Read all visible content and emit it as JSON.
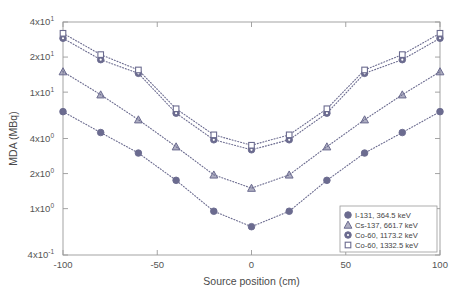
{
  "chart_data": {
    "type": "line",
    "title": "",
    "xlabel": "Source position (cm)",
    "ylabel": "MDA (MBq)",
    "yscale": "log",
    "xscale": "linear",
    "xlim": [
      -100,
      100
    ],
    "ylim": [
      0.4,
      40
    ],
    "grid": false,
    "legend_position": "lower right",
    "x": [
      -100,
      -80,
      -60,
      -40,
      -20,
      0,
      20,
      40,
      60,
      80,
      100
    ],
    "xticks": [
      -100,
      -50,
      0,
      50,
      100
    ],
    "xticklabels": [
      "-100",
      "-50",
      "0",
      "50",
      "100"
    ],
    "yticks": [
      0.4,
      1,
      2,
      4,
      10,
      20,
      40
    ],
    "yticklabels": [
      {
        "mant": "4x10",
        "exp": "-1"
      },
      {
        "mant": "1x10",
        "exp": "0"
      },
      {
        "mant": "2x10",
        "exp": "0"
      },
      {
        "mant": "4x10",
        "exp": "0"
      },
      {
        "mant": "1x10",
        "exp": "1"
      },
      {
        "mant": "2x10",
        "exp": "1"
      },
      {
        "mant": "4x10",
        "exp": "1"
      }
    ],
    "series": [
      {
        "name": "I-131, 364.5 keV",
        "marker": "circle-filled",
        "color": "#6b6b8f",
        "values": [
          6.8,
          4.5,
          3.0,
          1.75,
          0.95,
          0.7,
          0.95,
          1.75,
          3.0,
          4.5,
          6.8
        ]
      },
      {
        "name": "Cs-137, 661.7 keV",
        "marker": "triangle",
        "color": "#6b6b8f",
        "values": [
          15.0,
          9.5,
          5.8,
          3.4,
          1.95,
          1.5,
          1.95,
          3.4,
          5.8,
          9.5,
          15.0
        ]
      },
      {
        "name": "Co-60, 1173.2 keV",
        "marker": "circle-dot",
        "color": "#6b6b8f",
        "values": [
          29.0,
          19.0,
          14.5,
          6.6,
          3.9,
          3.2,
          3.9,
          6.6,
          14.5,
          19.0,
          29.0
        ]
      },
      {
        "name": "Co-60, 1332.5 keV",
        "marker": "square",
        "color": "#6b6b8f",
        "values": [
          32.0,
          21.0,
          15.5,
          7.2,
          4.3,
          3.5,
          4.3,
          7.2,
          15.5,
          21.0,
          32.0
        ]
      }
    ]
  },
  "legend": {
    "entries": [
      "I-131, 364.5 keV",
      "Cs-137, 661.7 keV",
      "Co-60, 1173.2 keV",
      "Co-60, 1332.5 keV"
    ]
  },
  "axes": {
    "xlabel": "Source position (cm)",
    "ylabel": "MDA (MBq)"
  },
  "colors": {
    "marker": "#6b6b8f",
    "line": "#8a8aa5",
    "axis": "#9a9a9a",
    "text": "#4a4a4a"
  }
}
